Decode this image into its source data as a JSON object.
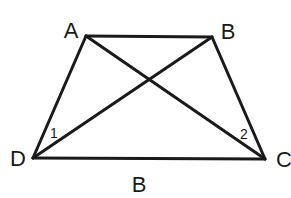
{
  "diagram": {
    "type": "trapezoid-with-diagonals",
    "vertices": {
      "A": {
        "label": "A",
        "x": 86,
        "y": 36
      },
      "B": {
        "label": "B",
        "x": 212,
        "y": 37
      },
      "C": {
        "label": "C",
        "x": 265,
        "y": 159
      },
      "D": {
        "label": "D",
        "x": 33,
        "y": 158
      }
    },
    "edges": [
      {
        "from": "A",
        "to": "B"
      },
      {
        "from": "B",
        "to": "C"
      },
      {
        "from": "C",
        "to": "D"
      },
      {
        "from": "D",
        "to": "A"
      },
      {
        "from": "A",
        "to": "C"
      },
      {
        "from": "B",
        "to": "D"
      }
    ],
    "labels": {
      "vertex_a": "A",
      "vertex_b": "B",
      "vertex_c": "C",
      "vertex_d": "D",
      "bottom_label": "B",
      "angle_1": "1",
      "angle_2": "2"
    }
  }
}
